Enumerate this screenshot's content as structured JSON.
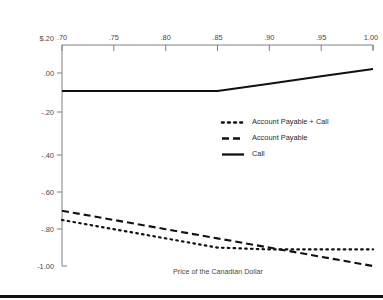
{
  "chart_data": {
    "type": "line",
    "title": "",
    "xlabel": "Price of the Canadian Dollar",
    "ylabel": "",
    "xlim": [
      0.7,
      1.0
    ],
    "ylim": [
      -1.0,
      0.2
    ],
    "grid": false,
    "x_axis_position": "top",
    "legend_position": "middle-right",
    "x_ticks": [
      0.7,
      0.75,
      0.8,
      0.85,
      0.9,
      0.95,
      1.0
    ],
    "x_tick_labels": [
      ".70",
      ".75",
      ".80",
      ".85",
      ".90",
      ".95",
      "1.00"
    ],
    "y_ticks": [
      0.2,
      0.0,
      -0.2,
      -0.4,
      -0.6,
      -0.8,
      -1.0
    ],
    "y_tick_labels": [
      "$.20",
      ".00",
      "-.20",
      "-.40",
      "-.60",
      "-.80",
      "-1.00"
    ],
    "series": [
      {
        "name": "Account Payable + Call",
        "style": "dotted",
        "color": "#111111",
        "x": [
          0.7,
          0.75,
          0.8,
          0.85,
          0.9,
          0.95,
          1.0
        ],
        "values": [
          -0.75,
          -0.8,
          -0.85,
          -0.9,
          -0.91,
          -0.91,
          -0.91
        ]
      },
      {
        "name": "Account Payable",
        "style": "dashed",
        "color": "#111111",
        "x": [
          0.7,
          0.75,
          0.8,
          0.85,
          0.9,
          0.95,
          1.0
        ],
        "values": [
          -0.7,
          -0.75,
          -0.8,
          -0.85,
          -0.9,
          -0.95,
          -1.0
        ]
      },
      {
        "name": "Call",
        "style": "solid",
        "color": "#111111",
        "x": [
          0.7,
          0.75,
          0.8,
          0.85,
          0.9,
          0.95,
          1.0
        ],
        "values": [
          -0.05,
          -0.05,
          -0.05,
          -0.05,
          -0.01,
          0.03,
          0.07
        ]
      }
    ]
  },
  "axis": {
    "x_labels": {
      "t0": ".70",
      "t1": ".75",
      "t2": ".80",
      "t3": ".85",
      "t4": ".90",
      "t5": ".95",
      "t6": "1.00"
    },
    "y_labels": {
      "t0": "$.20",
      "t1": ".00",
      "t2": "-.20",
      "t3": "-.40",
      "t4": "-.60",
      "t5": "-.80",
      "t6": "-1.00"
    },
    "x_title": "Price of the Canadian Dollar"
  },
  "legend": {
    "entries": {
      "e0": "Account Payable + Call",
      "e1": "Account Payable",
      "e2": "Call"
    }
  }
}
